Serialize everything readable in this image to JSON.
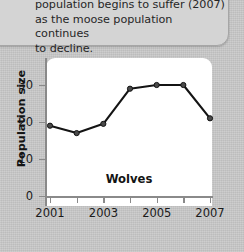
{
  "callout": {
    "text": "population begins to suffer (2007)\nas the moose population continues\nto decline."
  },
  "chart_data": {
    "type": "line",
    "title": "",
    "series_label": "Wolves",
    "xlabel": "",
    "ylabel": "Population size",
    "x": [
      2001,
      2002,
      2003,
      2004,
      2005,
      2006,
      2007
    ],
    "values": [
      19,
      17,
      19.5,
      29,
      30,
      30,
      21
    ],
    "series": [
      {
        "name": "Wolves",
        "values": [
          19,
          17,
          19.5,
          29,
          30,
          30,
          21
        ]
      }
    ],
    "xlim": [
      2001,
      2007
    ],
    "ylim": [
      0,
      32
    ],
    "x_tick_labels": [
      "2001",
      "2003",
      "2005",
      "2007"
    ],
    "x_tick_values": [
      2001,
      2003,
      2005,
      2007
    ],
    "x_minor_ticks": [
      2002,
      2004,
      2006
    ],
    "y_tick_labels": [
      "0",
      "10",
      "20",
      "30"
    ],
    "y_tick_values": [
      0,
      10,
      20,
      30
    ],
    "grid": false,
    "legend": "none",
    "line_color": "#1a1a1a",
    "marker_color": "#4a4a4a",
    "plot_background": "#ffffff"
  }
}
